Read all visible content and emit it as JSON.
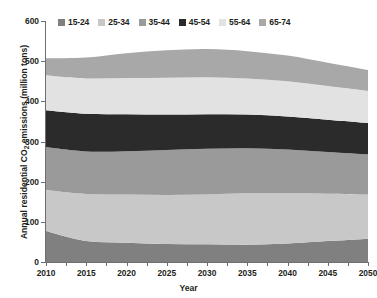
{
  "chart_data": {
    "type": "area",
    "stacked": true,
    "title": "",
    "xlabel": "Year",
    "ylabel": "Annual residential CO2 emissions (million tons)",
    "ylabel_parts": {
      "pre": "Annual residential CO",
      "sub": "2",
      "post": " emissions (million tons)"
    },
    "xlim": [
      2010,
      2050
    ],
    "ylim": [
      0,
      600
    ],
    "yticks": [
      0,
      100,
      200,
      300,
      400,
      500,
      600
    ],
    "xticks": [
      2010,
      2015,
      2020,
      2025,
      2030,
      2035,
      2040,
      2045,
      2050
    ],
    "grid": false,
    "legend_position": "top",
    "x": [
      2010,
      2015,
      2020,
      2025,
      2030,
      2035,
      2040,
      2045,
      2050
    ],
    "series": [
      {
        "name": "15-24",
        "color": "#808080",
        "values": [
          77,
          52,
          48,
          45,
          44,
          43,
          46,
          52,
          58
        ]
      },
      {
        "name": "25-34",
        "color": "#c8c8c8",
        "values": [
          102,
          117,
          120,
          122,
          124,
          128,
          126,
          118,
          110
        ]
      },
      {
        "name": "35-44",
        "color": "#9a9a9a",
        "values": [
          107,
          106,
          108,
          112,
          114,
          112,
          108,
          104,
          100
        ]
      },
      {
        "name": "45-54",
        "color": "#2b2b2b",
        "values": [
          92,
          94,
          92,
          88,
          86,
          84,
          82,
          80,
          78
        ]
      },
      {
        "name": "55-64",
        "color": "#e2e2e2",
        "values": [
          87,
          88,
          90,
          92,
          92,
          90,
          88,
          84,
          80
        ]
      },
      {
        "name": "65-74",
        "color": "#a8a8a8",
        "values": [
          42,
          52,
          62,
          68,
          70,
          68,
          64,
          58,
          52
        ]
      }
    ],
    "totals": [
      507,
      509,
      520,
      527,
      530,
      525,
      514,
      496,
      478
    ]
  },
  "legend": {
    "items": [
      {
        "label": "15-24",
        "color": "#808080"
      },
      {
        "label": "25-34",
        "color": "#c8c8c8"
      },
      {
        "label": "35-44",
        "color": "#9a9a9a"
      },
      {
        "label": "45-54",
        "color": "#2b2b2b"
      },
      {
        "label": "55-64",
        "color": "#e2e2e2"
      },
      {
        "label": "65-74",
        "color": "#a8a8a8"
      }
    ]
  },
  "axes": {
    "y_tick_labels": [
      "600",
      "500",
      "400",
      "300",
      "200",
      "100",
      "0"
    ],
    "x_tick_labels": [
      "2010",
      "2015",
      "2020",
      "2025",
      "2030",
      "2035",
      "2040",
      "2045",
      "2050"
    ],
    "x_title": "Year",
    "y_title_pre": "Annual residential CO",
    "y_title_sub": "2",
    "y_title_post": " emissions (million tons)"
  },
  "colors": {
    "axis": "#6e6e6e",
    "text": "#231f20",
    "background": "#ffffff"
  }
}
